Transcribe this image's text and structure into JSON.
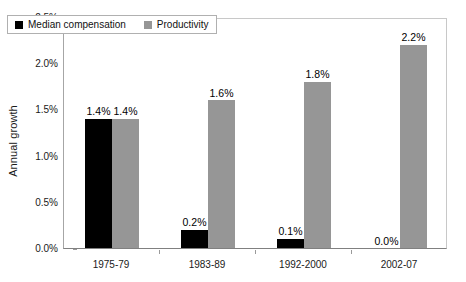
{
  "chart_data": {
    "type": "bar",
    "title": "",
    "subtitle": "",
    "xlabel": "",
    "ylabel": "Annual growth",
    "categories": [
      "1975-79",
      "1983-89",
      "1992-2000",
      "2002-07"
    ],
    "series": [
      {
        "name": "Median compensation",
        "color": "#000000",
        "values": [
          1.4,
          0.2,
          0.1,
          0.0
        ],
        "labels": [
          "1.4%",
          "0.2%",
          "0.1%",
          "0.0%"
        ]
      },
      {
        "name": "Productivity",
        "color": "#969696",
        "values": [
          1.4,
          1.6,
          1.8,
          2.2
        ],
        "labels": [
          "1.4%",
          "1.6%",
          "1.8%",
          "2.2%"
        ]
      }
    ],
    "ylim": [
      0,
      2.5
    ],
    "ytick_values": [
      0.0,
      0.5,
      1.0,
      1.5,
      2.0,
      2.5
    ],
    "ytick_labels": [
      "0.0%",
      "0.5%",
      "1.0%",
      "1.5%",
      "2.0%",
      "2.5%"
    ],
    "grid": false,
    "legend_position": "top-left-inside",
    "value_labels_shown": true,
    "units": "percent"
  },
  "legend": {
    "items": [
      {
        "label": "Median compensation",
        "swatch_color": "#000000",
        "swatch_icon": "square-marker-icon"
      },
      {
        "label": "Productivity",
        "swatch_color": "#969696",
        "swatch_icon": "square-marker-icon"
      }
    ]
  },
  "axes": {
    "y_title": "Annual growth",
    "y_ticks": [
      "2.5%",
      "2.0%",
      "1.5%",
      "1.0%",
      "0.5%",
      "0.0%"
    ],
    "x_ticks": [
      "1975-79",
      "1983-89",
      "1992-2000",
      "2002-07"
    ]
  },
  "colors": {
    "series_1": "#000000",
    "series_2": "#969696",
    "axis_line": "#808080",
    "frame_line": "#c8c8c8",
    "text": "#1a1a1a",
    "background": "#ffffff"
  }
}
